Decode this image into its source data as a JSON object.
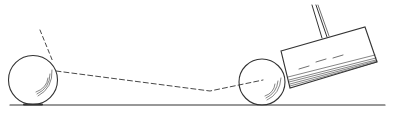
{
  "diagram": {
    "colors": {
      "stroke": "#333333",
      "background": "#ffffff"
    },
    "ground": {
      "x1": 10,
      "y1": 105,
      "x2": 385,
      "y2": 105
    },
    "left_ball": {
      "cx": 33,
      "cy": 80,
      "r": 25
    },
    "right_ball": {
      "cx": 262,
      "cy": 82,
      "r": 23
    },
    "trajectory": {
      "deflected": {
        "x1": 40,
        "y1": 30,
        "x2": 53,
        "y2": 62
      },
      "path": [
        [
          56,
          71
        ],
        [
          210,
          91
        ],
        [
          263,
          80
        ]
      ]
    },
    "mallet": {
      "head": [
        [
          281,
          51
        ],
        [
          365,
          27
        ],
        [
          377,
          62
        ],
        [
          290,
          88
        ]
      ],
      "handle": [
        [
          [
            312,
            5
          ],
          [
            322,
            38
          ]
        ],
        [
          [
            316,
            5
          ],
          [
            327,
            37
          ]
        ],
        [
          [
            318,
            5
          ],
          [
            329,
            36
          ]
        ]
      ]
    }
  }
}
